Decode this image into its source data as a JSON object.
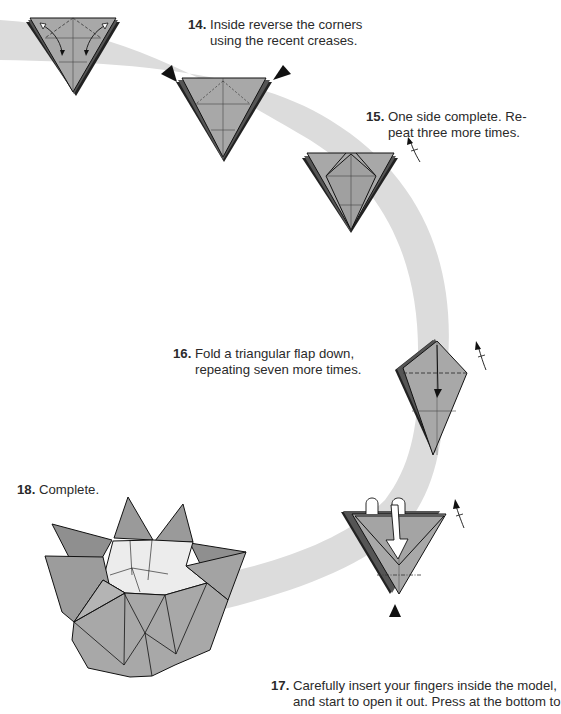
{
  "page": {
    "kind": "origami instruction diagram page",
    "colors": {
      "background": "#ffffff",
      "path_band": "#dcdcdc",
      "paper_fill": "#a8a8a8",
      "paper_inner_fill": "#eaeaea",
      "outline": "#111111",
      "text": "#2a2a2a"
    }
  },
  "steps": [
    {
      "number": "14.",
      "lines": [
        "Inside reverse the corners",
        "using the recent creases."
      ]
    },
    {
      "number": "15.",
      "lines": [
        "One side complete. Re-",
        "peat three more times."
      ]
    },
    {
      "number": "16.",
      "lines": [
        "Fold a triangular flap down,",
        "repeating seven more times."
      ]
    },
    {
      "number": "17.",
      "lines": [
        "Carefully insert your fingers inside the model,",
        "and start to open it out. Press at the bottom to"
      ]
    },
    {
      "number": "18.",
      "lines": [
        "Complete."
      ]
    }
  ],
  "diagrams": [
    {
      "id": "step14-crease",
      "symbols": [
        "valley-fold-dashed-lines",
        "fold-and-unfold-arrow",
        "fold-and-unfold-arrow"
      ]
    },
    {
      "id": "step14-reverse",
      "symbols": [
        "push-arrow-triangle",
        "push-arrow-triangle"
      ]
    },
    {
      "id": "step15-result",
      "symbols": [
        "turn-over-arrow"
      ]
    },
    {
      "id": "step16-flap",
      "symbols": [
        "valley-fold-dashed-line",
        "fold-down-arrow",
        "turn-over-arrow"
      ]
    },
    {
      "id": "step17-open",
      "symbols": [
        "open-loop-arrow",
        "open-loop-arrow",
        "hollow-down-arrow",
        "push-arrow-triangle",
        "turn-over-arrow"
      ]
    },
    {
      "id": "step18-complete",
      "symbols": []
    }
  ]
}
